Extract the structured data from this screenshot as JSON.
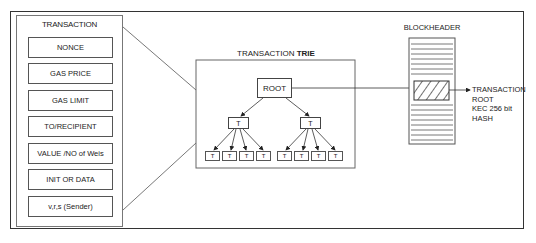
{
  "transaction": {
    "title": "TRANSACTION",
    "fields": [
      {
        "label": "NONCE"
      },
      {
        "label": "GAS PRICE"
      },
      {
        "label": "GAS LIMIT"
      },
      {
        "label": "TO/RECIPIENT"
      },
      {
        "label": "VALUE /NO of Weis"
      },
      {
        "label": "INIT OR DATA"
      },
      {
        "label": "v,r,s (Sender)"
      }
    ]
  },
  "trie": {
    "title_prefix": "TRANSACTION ",
    "title_bold": "TRIE",
    "root_label": "ROOT",
    "branch_label": "T",
    "leaf_label": "T"
  },
  "blockheader": {
    "title": "BLOCKHEADER",
    "output_lines": [
      "TRANSACTION",
      "ROOT",
      "KEC 256 bit",
      "HASH"
    ]
  }
}
